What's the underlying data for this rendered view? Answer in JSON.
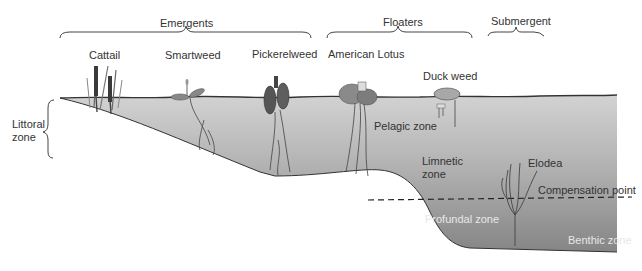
{
  "diagram": {
    "categories": {
      "emergents": "Emergents",
      "floaters": "Floaters",
      "submergent": "Submergent"
    },
    "plants": {
      "cattail": "Cattail",
      "smartweed": "Smartweed",
      "pickerelweed": "Pickerelweed",
      "american_lotus": "American Lotus",
      "duck_weed": "Duck weed",
      "elodea": "Elodea"
    },
    "zones": {
      "littoral_line1": "Littoral",
      "littoral_line2": "zone",
      "pelagic": "Pelagic zone",
      "limnetic_line1": "Limnetic",
      "limnetic_line2": "zone",
      "compensation_point": "Compensation point",
      "profundal": "Profundal zone",
      "benthic": "Benthic zone"
    },
    "colors": {
      "water_top": "#cfcfcf",
      "water_bottom": "#858585",
      "outline": "#333333",
      "plant_dark": "#555555"
    }
  }
}
